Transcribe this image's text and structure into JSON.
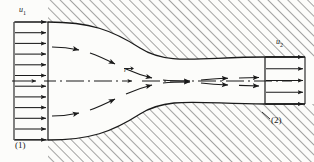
{
  "figure": {
    "type": "engineering-diagram",
    "width": 314,
    "height": 162,
    "background_color": "#fcfcfa",
    "line_color": "#1a1a1a",
    "hatch_color": "#2b2b2b"
  },
  "labels": {
    "inlet_velocity": "u",
    "inlet_velocity_subscript": "1",
    "outlet_velocity": "u",
    "outlet_velocity_subscript": "2",
    "section_one": "(1)",
    "section_two": "(2)",
    "centerline_vector": "r"
  },
  "geometry": {
    "inlet_section_x": 48,
    "inlet_top_y": 22,
    "inlet_bottom_y": 140,
    "outlet_section_x": 265,
    "outlet_top_y": 57,
    "outlet_bottom_y": 104,
    "centerline_y": 81,
    "upper_wall": "M48,22 C90,22 112,30 140,48 C168,66 200,57 265,57 L305,57",
    "lower_wall": "M48,140 C90,140 112,132 140,114 C168,96 200,104 265,104 L305,104",
    "inlet_profile_left_x": 14,
    "outlet_profile_right_x": 305
  },
  "inlet_profile": {
    "label": "uniform inlet velocity profile",
    "arrow_count": 12,
    "arrow_length": 34,
    "direction": "right",
    "top_y": 22,
    "bottom_y": 140
  },
  "outlet_profile": {
    "label": "uniform outlet velocity profile",
    "arrow_count": 5,
    "arrow_length": 40,
    "direction": "right",
    "top_y": 57,
    "bottom_y": 104
  },
  "streamlines": [
    {
      "name": "upper-streamline",
      "style": "dashed-with-arrowheads",
      "path": "M52,47 C92,47 118,55 146,68 C176,82 212,77 262,77"
    },
    {
      "name": "lower-streamline",
      "style": "dashed-with-arrowheads",
      "path": "M52,116 C92,116 118,108 146,95 C176,81 212,86 262,86"
    }
  ],
  "centerline": {
    "name": "axis-centerline",
    "style": "dash-dot",
    "y": 81,
    "start_x": 12,
    "end_x": 292,
    "has_arrowhead": true
  },
  "hatching": {
    "angle_degrees": 45,
    "spacing": 7,
    "regions": [
      "above-upper-wall",
      "below-lower-wall"
    ]
  }
}
